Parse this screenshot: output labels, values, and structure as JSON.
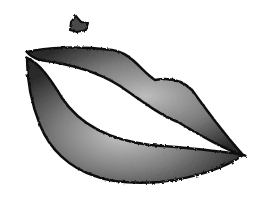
{
  "image": {
    "subject": "lips",
    "elements": [
      "upper-lip",
      "lower-lip",
      "beauty-mark"
    ],
    "colors": {
      "background": "#ffffff",
      "edge": "#111111",
      "shade_dark": "#3a3a3a",
      "shade_mid": "#7a7a7a",
      "highlight": "#c8c8c8"
    }
  }
}
